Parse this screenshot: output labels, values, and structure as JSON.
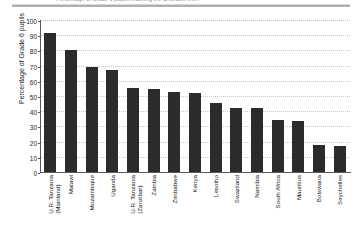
{
  "figure": {
    "title_visible_fragment": "Percentage of Grade 6 pupils reaching the desirable level"
  },
  "chart_data": {
    "type": "bar",
    "title": "",
    "xlabel": "",
    "ylabel": "Percentage of Grade 6 pupils",
    "ylim": [
      0,
      100
    ],
    "ytick_step": 10,
    "yticks": [
      0,
      10,
      20,
      30,
      40,
      50,
      60,
      70,
      80,
      90,
      100
    ],
    "grid": true,
    "grid_axis": "y",
    "legend": false,
    "bar_color": "#2b2b2b",
    "categories": [
      "U.R. Tanzania (Mainland)",
      "Malawi",
      "Mozambique",
      "Uganda",
      "U.R. Tanzania (Zanzibar)",
      "Zambia",
      "Zimbabwe",
      "Kenya",
      "Lesotho",
      "Swaziland",
      "Namibia",
      "South Africa",
      "Mauritius",
      "Botswana",
      "Seychelles"
    ],
    "category_lines": [
      [
        "U.R. Tanzania",
        "(Mainland)"
      ],
      [
        "Malawi",
        ""
      ],
      [
        "Mozambique",
        ""
      ],
      [
        "Uganda",
        ""
      ],
      [
        "U.R. Tanzania",
        "(Zanzibar)"
      ],
      [
        "Zambia",
        ""
      ],
      [
        "Zimbabwe",
        ""
      ],
      [
        "Kenya",
        ""
      ],
      [
        "Lesotho",
        ""
      ],
      [
        "Swaziland",
        ""
      ],
      [
        "Namibia",
        ""
      ],
      [
        "South Africa",
        ""
      ],
      [
        "Mauritius",
        ""
      ],
      [
        "Botswana",
        ""
      ],
      [
        "Seychelles",
        ""
      ]
    ],
    "values": [
      91.5,
      80,
      69,
      67,
      55,
      54.5,
      52.5,
      52,
      45.5,
      42,
      42,
      34.5,
      33.5,
      18,
      17
    ]
  }
}
